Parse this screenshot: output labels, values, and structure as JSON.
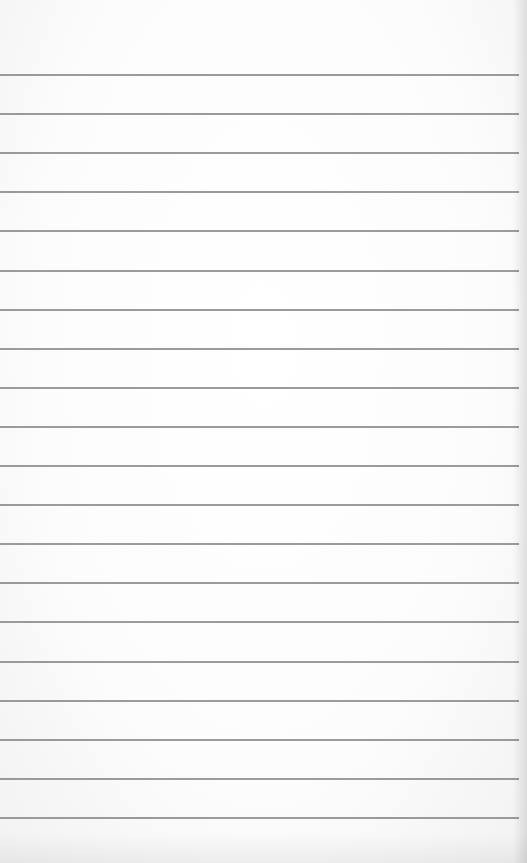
{
  "paper": {
    "type": "lined-notepad-page",
    "background_color": "#fbfbfb",
    "rule_color": "#8a8a8a",
    "rule_count": 20,
    "first_rule_y": 74,
    "rule_spacing": 39.1,
    "text": ""
  }
}
